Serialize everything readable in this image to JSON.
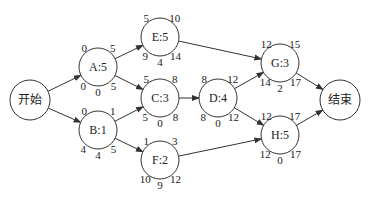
{
  "diagram": {
    "type": "activity-network",
    "nodes": [
      {
        "id": "start",
        "label": "开始",
        "cx": 30,
        "cy": 100,
        "r": 20
      },
      {
        "id": "A",
        "label": "A:5",
        "cx": 98,
        "cy": 67,
        "r": 19,
        "es": "0",
        "ef": "5",
        "ls": "0",
        "tf": "0",
        "lf": "5"
      },
      {
        "id": "B",
        "label": "B:1",
        "cx": 98,
        "cy": 130,
        "r": 19,
        "es": "0",
        "ef": "1",
        "ls": "4",
        "tf": "4",
        "lf": "5"
      },
      {
        "id": "E",
        "label": "E:5",
        "cx": 160,
        "cy": 37,
        "r": 19,
        "es": "5",
        "ef": "10",
        "ls": "9",
        "tf": "4",
        "lf": "14"
      },
      {
        "id": "C",
        "label": "C:3",
        "cx": 160,
        "cy": 98,
        "r": 19,
        "es": "5",
        "ef": "8",
        "ls": "5",
        "tf": "0",
        "lf": "8"
      },
      {
        "id": "F",
        "label": "F:2",
        "cx": 160,
        "cy": 160,
        "r": 19,
        "es": "1",
        "ef": "3",
        "ls": "10",
        "tf": "9",
        "lf": "12"
      },
      {
        "id": "D",
        "label": "D:4",
        "cx": 218,
        "cy": 98,
        "r": 19,
        "es": "8",
        "ef": "12",
        "ls": "8",
        "tf": "0",
        "lf": "12"
      },
      {
        "id": "G",
        "label": "G:3",
        "cx": 280,
        "cy": 63,
        "r": 19,
        "es": "12",
        "ef": "15",
        "ls": "14",
        "tf": "2",
        "lf": "17"
      },
      {
        "id": "H",
        "label": "H:5",
        "cx": 280,
        "cy": 135,
        "r": 19,
        "es": "12",
        "ef": "17",
        "ls": "12",
        "tf": "0",
        "lf": "17"
      },
      {
        "id": "end",
        "label": "结束",
        "cx": 340,
        "cy": 100,
        "r": 20
      }
    ],
    "edges": [
      [
        "start",
        "A"
      ],
      [
        "start",
        "B"
      ],
      [
        "A",
        "E"
      ],
      [
        "A",
        "C"
      ],
      [
        "B",
        "C"
      ],
      [
        "B",
        "F"
      ],
      [
        "E",
        "G"
      ],
      [
        "C",
        "D"
      ],
      [
        "D",
        "G"
      ],
      [
        "D",
        "H"
      ],
      [
        "F",
        "H"
      ],
      [
        "G",
        "end"
      ],
      [
        "H",
        "end"
      ]
    ]
  }
}
